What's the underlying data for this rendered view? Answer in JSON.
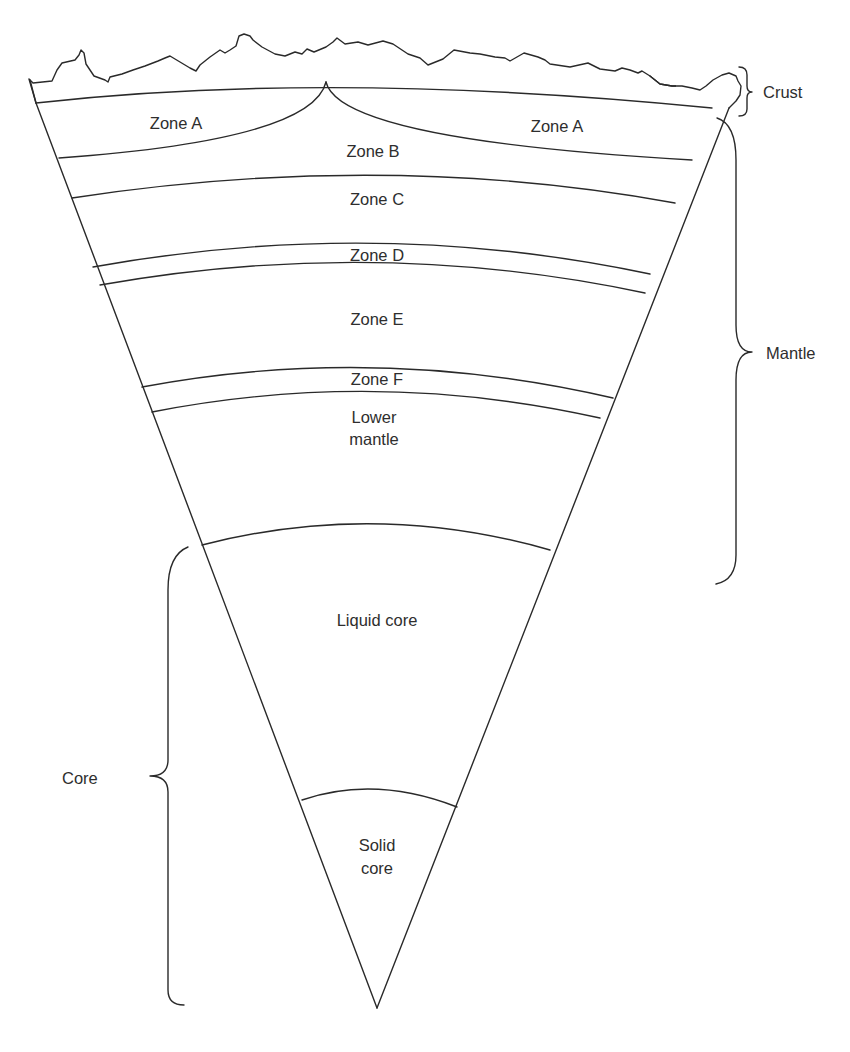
{
  "diagram": {
    "type": "Earth interior cross-section (wedge)",
    "layers": [
      {
        "id": "zone-a-left",
        "label": "Zone A"
      },
      {
        "id": "zone-a-right",
        "label": "Zone A"
      },
      {
        "id": "zone-b",
        "label": "Zone B"
      },
      {
        "id": "zone-c",
        "label": "Zone C"
      },
      {
        "id": "zone-d",
        "label": "Zone D"
      },
      {
        "id": "zone-e",
        "label": "Zone E"
      },
      {
        "id": "zone-f",
        "label": "Zone F"
      },
      {
        "id": "lower-mantle",
        "label_line1": "Lower",
        "label_line2": "mantle"
      },
      {
        "id": "liquid-core",
        "label": "Liquid core"
      },
      {
        "id": "solid-core",
        "label_line1": "Solid",
        "label_line2": "core"
      }
    ],
    "brackets": {
      "crust": "Crust",
      "mantle": "Mantle",
      "core": "Core"
    },
    "colors": {
      "line": "#2a2a2a",
      "text": "#2e2e2e",
      "background": "#ffffff"
    }
  }
}
